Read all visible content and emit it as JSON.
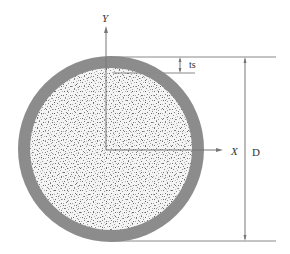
{
  "diagram": {
    "type": "cross-section",
    "labels": {
      "y_axis": "Y",
      "x_axis": "X",
      "thickness": "ts",
      "diameter": "D"
    },
    "colors": {
      "shell": "#8c8c8c",
      "core_background": "#f4f4f4",
      "core_speckle": "#6e6e6e",
      "lines": "#777777",
      "text": "#333333",
      "background": "#ffffff"
    },
    "geometry": {
      "center": [
        111,
        149
      ],
      "outer_radius": 93,
      "shell_thickness": 12
    }
  }
}
